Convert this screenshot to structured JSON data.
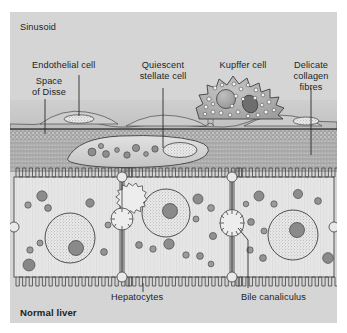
{
  "figure": {
    "panel_bg": "#d5d5d5",
    "page_bg": "#ffffff",
    "text_color": "#211f1f",
    "caption": "Normal liver"
  },
  "labels": {
    "sinusoid": "Sinusoid",
    "endothelial_cell": "Endothelial cell",
    "space_of_disse_l1": "Space",
    "space_of_disse_l2": "of Disse",
    "quiescent_l1": "Quiescent",
    "quiescent_l2": "stellate cell",
    "kupffer_cell": "Kupffer cell",
    "collagen_l1": "Delicate",
    "collagen_l2": "collagen",
    "collagen_l3": "fibres",
    "hepatocytes": "Hepatocytes",
    "bile_canaliculus": "Bile canaliculus"
  },
  "structures": {
    "sinusoid_lumen": "sinusoid-lumen",
    "endothelial_lining": "endothelial-lining",
    "space_of_disse": "space-of-disse",
    "collagen_band": "collagen-fibre-band",
    "stellate_cell": "quiescent-stellate-cell",
    "kupffer_cell": "kupffer-cell",
    "hepatocyte_count": 3,
    "bile_canaliculus_count": 3,
    "microvilli_band": "hepatocyte-microvilli"
  },
  "colors": {
    "panel": "#d5d5d5",
    "sinusoid": "#c9c9c9",
    "endothelium": "#bdbdbd",
    "disse": "#a8a8a8",
    "stellate_fill": "#d9d9d9",
    "kupffer_fill": "#b5b5b5",
    "hepatocyte_fill": "#e4e4e4",
    "nucleus_fill": "#ebebeb",
    "granule_dark": "#8c8c8c",
    "granule_mid": "#a0a0a0",
    "outline": "#3a3a3a"
  }
}
